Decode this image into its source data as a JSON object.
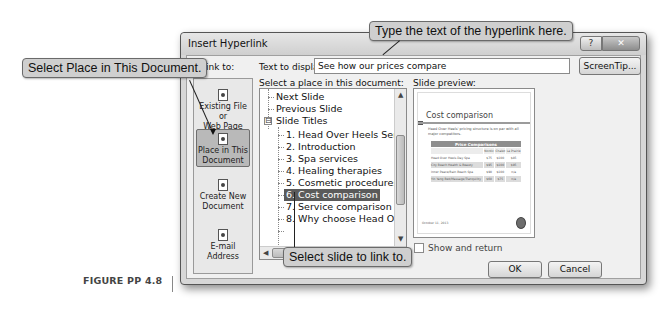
{
  "dialog": {
    "title": "Insert Hyperlink",
    "help_label": "?",
    "close_label": "✕",
    "link_to_label": "Link to:",
    "text_to_display_label": "Text to display:",
    "text_to_display_value": "See how our prices compare",
    "screentip_label": "ScreenTip...",
    "select_place_label": "Select a place in this document:",
    "slide_preview_label": "Slide preview:",
    "show_and_return_label": "Show and return",
    "show_and_return_checked": false,
    "ok_label": "OK",
    "cancel_label": "Cancel"
  },
  "link_to": {
    "items": [
      {
        "label": "Existing File or Web Page",
        "line1": "Existing File or",
        "line2": "Web Page",
        "icon": "web-page-icon",
        "selected": false
      },
      {
        "label": "Place in This Document",
        "line1": "Place in This",
        "line2": "Document",
        "icon": "document-place-icon",
        "selected": true
      },
      {
        "label": "Create New Document",
        "line1": "Create New",
        "line2": "Document",
        "icon": "new-document-icon",
        "selected": false
      },
      {
        "label": "E-mail Address",
        "line1": "E-mail Address",
        "line2": "",
        "icon": "email-icon",
        "selected": false
      }
    ]
  },
  "tree": {
    "items": [
      {
        "label": "Next Slide",
        "level": 0
      },
      {
        "label": "Previous Slide",
        "level": 0
      },
      {
        "label": "Slide Titles",
        "level": 0,
        "expander": "⊟"
      },
      {
        "label": "1. Head Over Heels Services",
        "level": 1
      },
      {
        "label": "2. Introduction",
        "level": 1
      },
      {
        "label": "3. Spa services",
        "level": 1
      },
      {
        "label": "4. Healing therapies",
        "level": 1
      },
      {
        "label": "5. Cosmetic procedures",
        "level": 1
      },
      {
        "label": "6. Cost comparison",
        "level": 1,
        "selected": true
      },
      {
        "label": "7. Service comparison",
        "level": 1
      },
      {
        "label": "8. Why choose Head Over Heels",
        "level": 1
      }
    ],
    "hscroll_grip": "|||"
  },
  "preview": {
    "slide_title": "Cost comparison",
    "bullet": "Head Over Heels' pricing structure is on par with all major competitors.",
    "table_caption": "Price Comparisons",
    "columns": [
      "",
      "Nordic",
      "Chalet",
      "La Prairie"
    ],
    "rows": [
      [
        "Head Over Heels Day Spa",
        "$75",
        "$100",
        "$85"
      ],
      [
        "City Beach Health & Beauty",
        "$95",
        "$100",
        "$95"
      ],
      [
        "Inner Peace/Rain Beach Spa",
        "$90",
        "$100",
        "n/a"
      ],
      [
        "Yin Yang Bed/Massage/Tranquility",
        "$60",
        "$75",
        "n/a"
      ]
    ],
    "date": "October 11, 2013"
  },
  "callouts": {
    "top": "Type the text of the hyperlink here.",
    "left": "Select Place in This Document.",
    "bottom": "Select slide to link to."
  },
  "figure_label": "FIGURE PP 4.8"
}
